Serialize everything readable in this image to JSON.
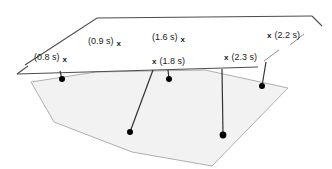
{
  "figure": {
    "title": "",
    "background_color": "#ffffff",
    "plane_line_color": "#4d4d4d",
    "polygon_fill_color": "#f2f2f2",
    "polygon_stroke_color": "#a6a6a6",
    "ray_line_color": "#333333",
    "dot_color": "#000000",
    "text_color": "#1a1a1a"
  },
  "labels": [
    {
      "id": "t-0-8",
      "text": "(0.8 s)",
      "marker": "x",
      "marker_side": "right",
      "x": 34,
      "y": 53
    },
    {
      "id": "t-0-9",
      "text": "(0.9 s)",
      "marker": "x",
      "marker_side": "right",
      "x": 88,
      "y": 37
    },
    {
      "id": "t-1-6",
      "text": "(1.6 s)",
      "marker": "x",
      "marker_side": "right",
      "x": 152,
      "y": 33
    },
    {
      "id": "t-1-8",
      "text": "(1.8 s)",
      "marker": "x",
      "marker_side": "left",
      "x": 152,
      "y": 57
    },
    {
      "id": "t-2-3",
      "text": "(2.3 s)",
      "marker": "x",
      "marker_side": "left",
      "x": 224,
      "y": 53
    },
    {
      "id": "t-2-2",
      "text": "(2.2 s)",
      "marker": "x",
      "marker_side": "left",
      "x": 267,
      "y": 31
    }
  ],
  "markers": {
    "glyph": "x",
    "count": 6
  },
  "geometry": {
    "plane_top_edge": "M 25,65 L 97,18 L 312,16",
    "plane_right_tick": "M 312,16 L 322,26",
    "plane_mid_tick": "M 290,45 L 304,34",
    "horizon_line": "M 17,74 L 258,67",
    "horizon_left_tick": "M 17,74 L 28,66",
    "horizon_right_tick": "M 264,61 L 279,50",
    "polygon": "M 31,82 L 54,122 L 132,152 L 212,166 L 288,88 L 205,70 L 96,72 Z",
    "rays": [
      {
        "id": "ray-0-8",
        "from": [
          60,
          71
        ],
        "to": [
          62,
          79
        ]
      },
      {
        "id": "ray-1-6",
        "from": [
          168,
          70
        ],
        "to": [
          169,
          79
        ]
      },
      {
        "id": "ray-1-8",
        "from": [
          153,
          70
        ],
        "to": [
          130,
          132
        ]
      },
      {
        "id": "ray-2-3",
        "from": [
          222,
          69
        ],
        "to": [
          223,
          135
        ]
      },
      {
        "id": "ray-2-2",
        "from": [
          266,
          62
        ],
        "to": [
          262,
          86
        ]
      }
    ],
    "dots": [
      {
        "id": "dot-0-8",
        "cx": 62,
        "cy": 79,
        "r": 3
      },
      {
        "id": "dot-1-6",
        "cx": 169,
        "cy": 79,
        "r": 3
      },
      {
        "id": "dot-1-8",
        "cx": 130,
        "cy": 132,
        "r": 3
      },
      {
        "id": "dot-2-3",
        "cx": 223,
        "cy": 135,
        "r": 3.4
      },
      {
        "id": "dot-2-2",
        "cx": 262,
        "cy": 86,
        "r": 3
      }
    ]
  }
}
